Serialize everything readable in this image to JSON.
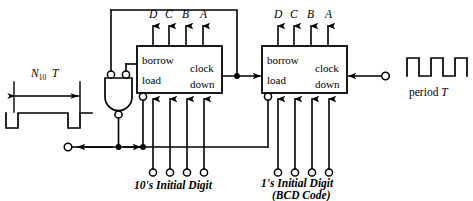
{
  "figure": {
    "type": "logic-circuit-diagram",
    "background_color": "#ffffff",
    "line_color": "#000000"
  },
  "left_waveform": {
    "dimension_label_text": "N",
    "dimension_label_sub": "10",
    "dimension_label_var": "T",
    "description": "single negative-going output pulse of width N10 T"
  },
  "right_waveform": {
    "label": "period T",
    "label_text": "period",
    "label_var": "T",
    "description": "square-wave clock input of period T"
  },
  "counters": [
    {
      "id": "tens",
      "name": "10's decade counter",
      "pins": {
        "borrow": "borrow",
        "load": "load",
        "clock": "clock",
        "down": "down"
      },
      "outputs": [
        "D",
        "C",
        "B",
        "A"
      ],
      "caption_line1": "10's Initial Digit",
      "caption_line2": ""
    },
    {
      "id": "ones",
      "name": "1's decade counter",
      "pins": {
        "borrow": "borrow",
        "load": "load",
        "clock": "clock",
        "down": "down"
      },
      "outputs": [
        "D",
        "C",
        "B",
        "A"
      ],
      "caption_line1": "1's Initial Digit",
      "caption_line2": "(BCD Code)"
    }
  ],
  "gate": {
    "type": "nand-gate",
    "inputs": 2,
    "input_bubbles": true,
    "output_bubble": true
  },
  "terminals": {
    "start_input": "start trigger terminal",
    "clock_input": "clock terminal",
    "preset_count": 4
  }
}
